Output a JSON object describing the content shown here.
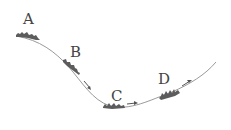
{
  "diagram": {
    "type": "track-motion-diagram",
    "curve": {
      "description": "smooth track descending from upper-left to a valley bottom then rising to the right",
      "color": "#9a9a9a"
    },
    "points": [
      {
        "id": "A",
        "label": "A",
        "arrow": "none"
      },
      {
        "id": "B",
        "label": "B",
        "arrow": "down-right"
      },
      {
        "id": "C",
        "label": "C",
        "arrow": "right"
      },
      {
        "id": "D",
        "label": "D",
        "arrow": "up-right"
      }
    ],
    "colors": {
      "object": "#5c5c5c",
      "label": "#444444",
      "arrow": "#555555"
    }
  }
}
